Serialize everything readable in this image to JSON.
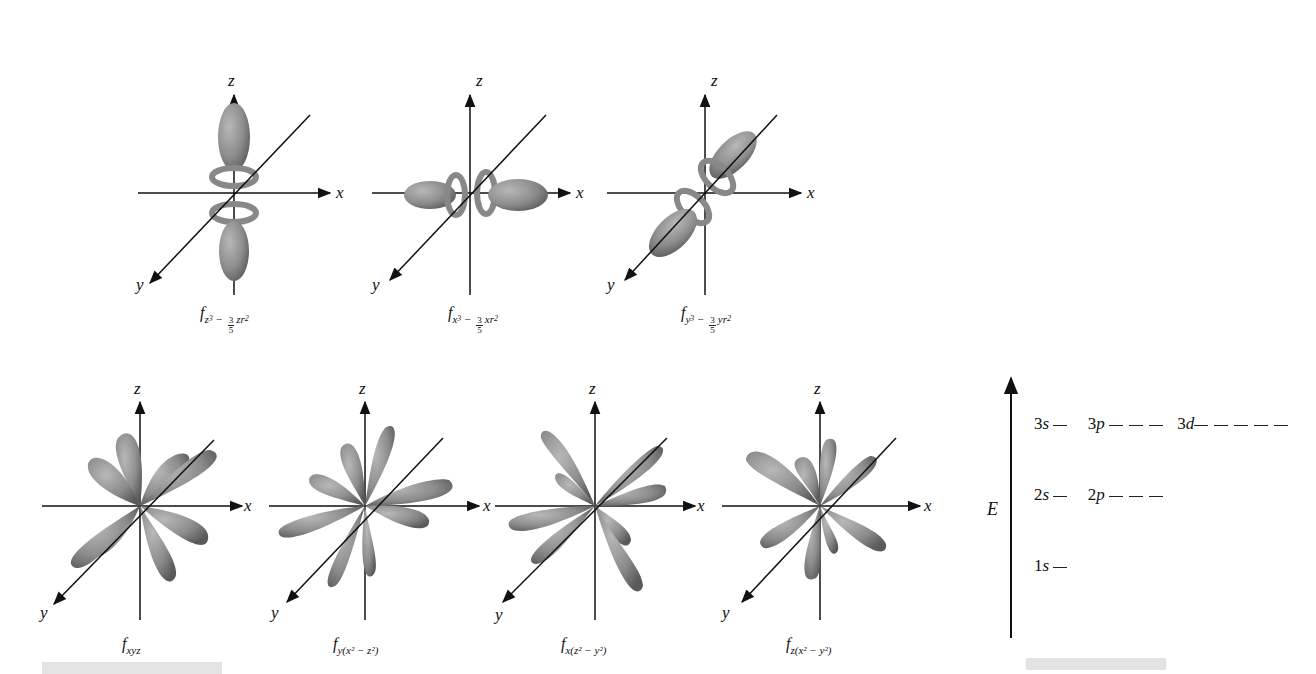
{
  "figure": {
    "colors": {
      "lobe": "#8e8e8e",
      "lobe_dark": "#5e5e5e",
      "lobe_light": "#b4b4b4",
      "axis": "#111111",
      "gray_bar": "#e4e4e4"
    },
    "axis_labels": {
      "x": "x",
      "y": "y",
      "z": "z"
    },
    "top_row": [
      {
        "id": "fz3",
        "caption_main": "f",
        "sub_var": "z",
        "sub_exp": "3",
        "minus": "−",
        "frac_num": "3",
        "frac_den": "5",
        "sub_tail": "zr",
        "tail_exp": "2",
        "lobe_axis": "z"
      },
      {
        "id": "fx3",
        "caption_main": "f",
        "sub_var": "x",
        "sub_exp": "3",
        "minus": "−",
        "frac_num": "3",
        "frac_den": "5",
        "sub_tail": "xr",
        "tail_exp": "2",
        "lobe_axis": "x"
      },
      {
        "id": "fy3",
        "caption_main": "f",
        "sub_var": "y",
        "sub_exp": "3",
        "minus": "−",
        "frac_num": "3",
        "frac_den": "5",
        "sub_tail": "yr",
        "tail_exp": "2",
        "lobe_axis": "y"
      }
    ],
    "bottom_row": [
      {
        "id": "fxyz",
        "caption_main": "f",
        "caption_sub": "xyz"
      },
      {
        "id": "fy(x2-z2)",
        "caption_main": "f",
        "caption_sub": "y(x² − z²)"
      },
      {
        "id": "fx(z2-y2)",
        "caption_main": "f",
        "caption_sub": "x(z² − y²)"
      },
      {
        "id": "fz(x2-y2)",
        "caption_main": "f",
        "caption_sub": "z(x² − y²)"
      }
    ]
  },
  "energy_diagram": {
    "axis_label": "E",
    "levels": [
      {
        "row": "n3",
        "entries": [
          {
            "n": "3",
            "l": "s",
            "count": 1
          },
          {
            "n": "3",
            "l": "p",
            "count": 3
          },
          {
            "n": "3",
            "l": "d",
            "count": 5
          }
        ]
      },
      {
        "row": "n2",
        "entries": [
          {
            "n": "2",
            "l": "s",
            "count": 1
          },
          {
            "n": "2",
            "l": "p",
            "count": 3
          }
        ]
      },
      {
        "row": "n1",
        "entries": [
          {
            "n": "1",
            "l": "s",
            "count": 1
          }
        ]
      }
    ],
    "labels": {
      "l3s_n": "3",
      "l3s_l": "s",
      "l3p_n": "3",
      "l3p_l": "p",
      "l3d_n": "3",
      "l3d_l": "d",
      "l2s_n": "2",
      "l2s_l": "s",
      "l2p_n": "2",
      "l2p_l": "p",
      "l1s_n": "1",
      "l1s_l": "s"
    }
  }
}
